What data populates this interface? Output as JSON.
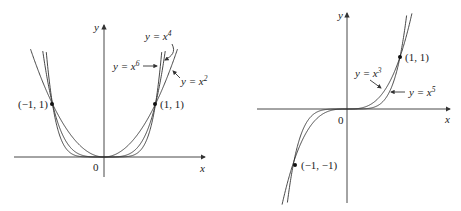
{
  "figures": [
    {
      "id": "even-powers",
      "axes": {
        "x_label": "x",
        "y_label": "y",
        "origin_label": "0"
      },
      "curves": [
        {
          "label_prefix": "y = x",
          "exponent": "2",
          "power": 2
        },
        {
          "label_prefix": "y = x",
          "exponent": "4",
          "power": 4
        },
        {
          "label_prefix": "y = x",
          "exponent": "6",
          "power": 6
        }
      ],
      "points": [
        {
          "label": "(−1, 1)",
          "x": -1,
          "y": 1
        },
        {
          "label": "(1, 1)",
          "x": 1,
          "y": 1
        }
      ]
    },
    {
      "id": "odd-powers",
      "axes": {
        "x_label": "x",
        "y_label": "y",
        "origin_label": "0"
      },
      "curves": [
        {
          "label_prefix": "y = x",
          "exponent": "3",
          "power": 3
        },
        {
          "label_prefix": "y = x",
          "exponent": "5",
          "power": 5
        }
      ],
      "points": [
        {
          "label": "(1, 1)",
          "x": 1,
          "y": 1
        },
        {
          "label": "(−1, −1)",
          "x": -1,
          "y": -1
        }
      ]
    }
  ]
}
